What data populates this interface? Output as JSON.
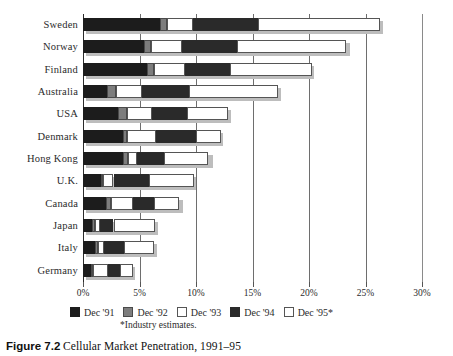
{
  "caption": {
    "figure_number": "Figure 7.2",
    "text": "Cellular Market Penetration, 1991–95"
  },
  "footnote": "*Industry estimates.",
  "legend": {
    "items": [
      {
        "label": "Dec '91",
        "color": "#1c1c1c",
        "key": "d91"
      },
      {
        "label": "Dec '92",
        "color": "#7d7d7d",
        "key": "d92"
      },
      {
        "label": "Dec '93",
        "color": "#ffffff",
        "key": "d93"
      },
      {
        "label": "Dec '94",
        "color": "#2a2a2a",
        "key": "d94"
      },
      {
        "label": "Dec '95*",
        "color": "#ffffff",
        "key": "d95"
      }
    ]
  },
  "chart_data": {
    "type": "bar",
    "orientation": "horizontal",
    "stacked": true,
    "title": "Cellular Market Penetration, 1991–95",
    "xlabel": "",
    "ylabel": "",
    "xlim": [
      0,
      30
    ],
    "xunit": "%",
    "grid": true,
    "legend_position": "bottom",
    "xticks": [
      0,
      5,
      10,
      15,
      20,
      25,
      30
    ],
    "xticklabels": [
      "0%",
      "5%",
      "10%",
      "15%",
      "20%",
      "25%",
      "30%"
    ],
    "categories": [
      "Sweden",
      "Norway",
      "Finland",
      "Australia",
      "USA",
      "Denmark",
      "Hong Kong",
      "U.K.",
      "Canada",
      "Japan",
      "Italy",
      "Germany"
    ],
    "series": [
      {
        "name": "Dec '91",
        "values": [
          6.8,
          5.4,
          5.7,
          2.1,
          3.1,
          3.5,
          3.5,
          1.6,
          2.0,
          0.8,
          1.1,
          0.7
        ]
      },
      {
        "name": "Dec '92",
        "values": [
          0.6,
          0.6,
          0.6,
          0.8,
          0.8,
          0.4,
          0.5,
          0.2,
          0.5,
          0.3,
          0.2,
          0.2
        ]
      },
      {
        "name": "Dec '93",
        "values": [
          2.3,
          2.8,
          2.7,
          2.3,
          2.2,
          2.6,
          0.8,
          0.9,
          1.9,
          0.4,
          0.6,
          1.3
        ]
      },
      {
        "name": "Dec '94",
        "values": [
          5.8,
          4.8,
          4.0,
          4.2,
          3.1,
          3.5,
          2.4,
          3.1,
          1.9,
          1.2,
          1.7,
          1.1
        ]
      },
      {
        "name": "Dec '95*",
        "values": [
          10.8,
          9.7,
          7.3,
          7.9,
          3.6,
          2.2,
          3.9,
          4.0,
          2.2,
          3.7,
          2.7,
          1.1
        ]
      }
    ],
    "totals": [
      26.3,
      23.4,
      20.2,
      17.3,
      12.8,
      12.1,
      11.2,
      9.7,
      8.6,
      6.4,
      6.3,
      4.3
    ]
  }
}
